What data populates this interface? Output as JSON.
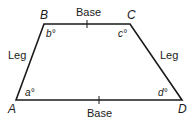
{
  "diagram": {
    "shape": "trapezoid",
    "vertices": [
      {
        "name": "A",
        "angle": "a°"
      },
      {
        "name": "B",
        "angle": "b°"
      },
      {
        "name": "C",
        "angle": "c°"
      },
      {
        "name": "D",
        "angle": "d°"
      }
    ],
    "sides": {
      "top": "Base",
      "bottom": "Base",
      "left": "Leg",
      "right": "Leg"
    },
    "line_color": "#1a1a1a"
  }
}
